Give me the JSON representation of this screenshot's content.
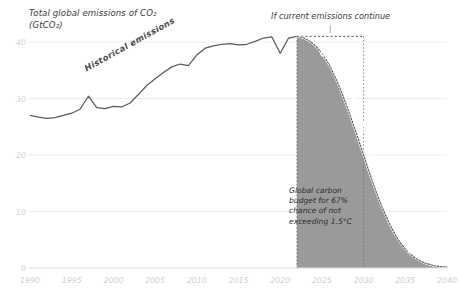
{
  "title": "Total global emissions of CO₂\n(GtCO₂)",
  "annotations": {
    "top_scenario": "If current emissions continue",
    "budget_note": "Global carbon\nbudget for 67%\nchance of not\nexceeding 1.5°C",
    "historical_label": "Historical emissions",
    "pathway_label": "Global pathway for a ‘likely chance’ of 1.5°C"
  },
  "colors": {
    "line": "#5a5a5a",
    "shade": "#9a9a9a",
    "grid": "#ededed",
    "tick_text": "#cfcfcf",
    "body_text": "#3b3b3b",
    "dashed": "#707070"
  },
  "chart_data": {
    "type": "area",
    "xlabel": "",
    "ylabel": "GtCO2",
    "xlim": [
      1990,
      2040
    ],
    "ylim": [
      0,
      42
    ],
    "yticks": [
      0,
      10,
      20,
      30,
      40
    ],
    "xticks": [
      1990,
      1995,
      2000,
      2005,
      2010,
      2015,
      2020,
      2025,
      2030,
      2035,
      2040
    ],
    "grid": true,
    "legend": "none",
    "series": [
      {
        "name": "Historical emissions",
        "kind": "line",
        "x": [
          1990,
          1991,
          1992,
          1993,
          1994,
          1995,
          1996,
          1997,
          1998,
          1999,
          2000,
          2001,
          2002,
          2003,
          2004,
          2005,
          2006,
          2007,
          2008,
          2009,
          2010,
          2011,
          2012,
          2013,
          2014,
          2015,
          2016,
          2017,
          2018,
          2019,
          2020,
          2021,
          2022
        ],
        "values": [
          27.0,
          26.7,
          26.5,
          26.6,
          27.0,
          27.4,
          28.1,
          30.4,
          28.4,
          28.2,
          28.6,
          28.5,
          29.2,
          30.7,
          32.3,
          33.5,
          34.6,
          35.6,
          36.1,
          35.8,
          37.7,
          38.9,
          39.3,
          39.6,
          39.7,
          39.5,
          39.6,
          40.1,
          40.7,
          40.9,
          38.0,
          40.7,
          41.0
        ]
      },
      {
        "name": "Global pathway for a ‘likely chance’ of 1.5°C",
        "kind": "area",
        "x": [
          2022,
          2023,
          2024,
          2025,
          2026,
          2027,
          2028,
          2029,
          2030,
          2031,
          2032,
          2033,
          2034,
          2035,
          2036,
          2037,
          2038,
          2039,
          2040
        ],
        "values": [
          41.0,
          40.6,
          39.6,
          38.0,
          35.6,
          32.4,
          28.6,
          24.4,
          20.0,
          15.6,
          11.6,
          8.2,
          5.4,
          3.4,
          2.0,
          1.1,
          0.6,
          0.3,
          0.2
        ]
      }
    ],
    "markers": {
      "budget_region_start_year": 2022,
      "budget_region_end_year": 2040,
      "reference_level_gtco2": 41.0,
      "dashed_vertical_years": [
        2022,
        2030
      ],
      "dashed_horizontal_level": 41.0
    }
  }
}
